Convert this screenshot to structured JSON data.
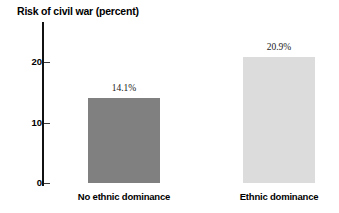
{
  "chart_data": {
    "type": "bar",
    "title": "Risk of civil war (percent)",
    "xlabel": "",
    "ylabel": "",
    "categories": [
      "No ethnic dominance",
      "Ethnic dominance"
    ],
    "values": [
      14.1,
      20.9
    ],
    "value_labels": [
      "14.1%",
      "20.9%"
    ],
    "ylim": [
      0,
      27
    ],
    "yticks": [
      0,
      10,
      20
    ],
    "ytick_labels": [
      "0",
      "10",
      "20"
    ],
    "grid": false,
    "legend": null,
    "series": [
      {
        "name": "Risk of civil war",
        "values": [
          14.1,
          20.9
        ],
        "colors": [
          "#808080",
          "#dcdcdc"
        ]
      }
    ],
    "colors": {
      "bar_no_ethnic_dominance": "#808080",
      "bar_ethnic_dominance": "#dcdcdc",
      "axis": "#111111",
      "text": "#000000",
      "background": "#ffffff"
    }
  }
}
